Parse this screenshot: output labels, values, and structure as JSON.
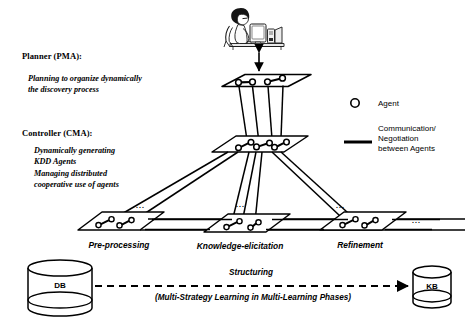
{
  "figure": {
    "type": "architecture-diagram"
  },
  "annotations": {
    "planner": {
      "heading": "Planner (PMA):",
      "body_lines": [
        "Planning to organize dynamically",
        "the discovery process"
      ]
    },
    "controller": {
      "heading": "Controller (CMA):",
      "body_lines": [
        "Dynamically generating",
        "KDD Agents",
        "Managing distributed",
        "cooperative use of agents"
      ]
    }
  },
  "legend": {
    "agent": {
      "icon": "circle-outline-icon",
      "label": "Agent"
    },
    "communication": {
      "icon": "thick-line-icon",
      "label_lines": [
        "Communication/",
        "Negotiation",
        "between Agents"
      ]
    }
  },
  "planes": {
    "planner_layer": {
      "caption": "",
      "agent_count": 4
    },
    "controller_layer": {
      "caption": "",
      "agent_count": 6
    },
    "task_layers": [
      {
        "caption": "Pre-processing",
        "agent_count": 4
      },
      {
        "caption": "Knowledge-elicitation",
        "agent_count": 4
      },
      {
        "caption": "Refinement",
        "agent_count": 4
      }
    ]
  },
  "ellipses": {
    "mark": "..."
  },
  "stores": {
    "source": {
      "label": "DB",
      "shape": "cylinder"
    },
    "target": {
      "label": "KB",
      "shape": "cylinder"
    }
  },
  "flow": {
    "title": "Structuring",
    "subtitle": "(Multi-Strategy Learning in Multi-Learning Phases)",
    "arrow_style": "dashed-right-arrow"
  },
  "user": {
    "icon": "person-at-computer-icon",
    "link": "double-headed-vertical-arrow"
  },
  "colors": {
    "ink": "#000000",
    "paper": "#ffffff",
    "shade": "#f3f3f3"
  }
}
